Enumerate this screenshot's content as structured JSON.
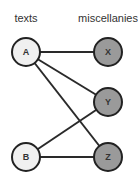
{
  "diagram": {
    "type": "bipartite-graph",
    "columns": {
      "left": {
        "label": "texts",
        "fill": "#f0f0f0"
      },
      "right": {
        "label": "miscellanies",
        "fill": "#9a9a9a"
      }
    },
    "nodes": [
      {
        "id": "A",
        "label": "A",
        "side": "left"
      },
      {
        "id": "B",
        "label": "B",
        "side": "left"
      },
      {
        "id": "X",
        "label": "X",
        "side": "right"
      },
      {
        "id": "Y",
        "label": "Y",
        "side": "right"
      },
      {
        "id": "Z",
        "label": "Z",
        "side": "right"
      }
    ],
    "edges": [
      {
        "from": "A",
        "to": "X"
      },
      {
        "from": "A",
        "to": "Y"
      },
      {
        "from": "A",
        "to": "Z"
      },
      {
        "from": "B",
        "to": "Y"
      },
      {
        "from": "B",
        "to": "Z"
      }
    ]
  }
}
